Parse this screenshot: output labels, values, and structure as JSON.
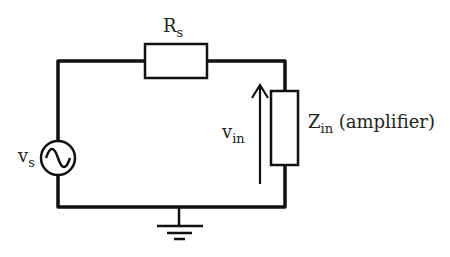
{
  "diagram": {
    "type": "circuit",
    "components": {
      "source": {
        "symbol": "v",
        "subscript": "s",
        "kind": "ac-voltage-source"
      },
      "series_resistor": {
        "symbol": "R",
        "subscript": "s"
      },
      "load": {
        "symbol": "Z",
        "subscript": "in",
        "suffix": " (amplifier)"
      },
      "voltage_arrow": {
        "symbol": "v",
        "subscript": "in"
      },
      "ground": {
        "kind": "ground"
      }
    },
    "colors": {
      "wire": "#111111",
      "text": "#222222",
      "background": "#ffffff"
    }
  }
}
